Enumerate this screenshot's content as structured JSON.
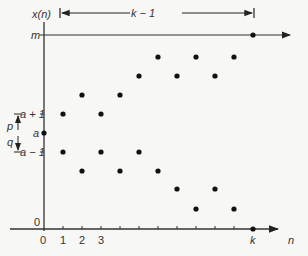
{
  "diagram": {
    "y_axis_label": "x(n)",
    "x_axis_label": "n",
    "span_label": "k − 1",
    "level_labels": {
      "m": "m",
      "a_plus_1": "a + 1",
      "a": "a",
      "a_minus_1": "a − 1",
      "zero": "0",
      "p": "p",
      "q": "q"
    },
    "x_tick_labels": [
      "0",
      "1",
      "2",
      "3"
    ],
    "k_label": "k",
    "points_px": [
      [
        44,
        133
      ],
      [
        63,
        114
      ],
      [
        82,
        95
      ],
      [
        101,
        114
      ],
      [
        120,
        95
      ],
      [
        139,
        76
      ],
      [
        158,
        57
      ],
      [
        177,
        76
      ],
      [
        196,
        57
      ],
      [
        215,
        76
      ],
      [
        234,
        57
      ],
      [
        253,
        35
      ],
      [
        63,
        152
      ],
      [
        82,
        171
      ],
      [
        101,
        152
      ],
      [
        120,
        171
      ],
      [
        139,
        152
      ],
      [
        158,
        171
      ],
      [
        177,
        189
      ],
      [
        196,
        209
      ],
      [
        215,
        189
      ],
      [
        234,
        209
      ],
      [
        253,
        229
      ]
    ],
    "colors": {
      "ink": "#222222",
      "background": "#f7f7f5"
    }
  }
}
